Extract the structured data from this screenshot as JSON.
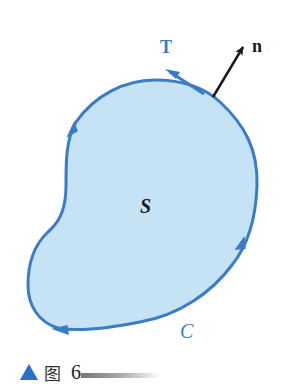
{
  "figure": {
    "labels": {
      "tangent": "T",
      "normal": "n",
      "surface": "S",
      "curve": "C"
    },
    "colors": {
      "region_fill": "#c6e3f6",
      "outline": "#3a7cc6",
      "normal_arrow": "#1a1a1a"
    },
    "icons": [
      "tangent-arrow",
      "normal-arrow",
      "orientation-arrow"
    ]
  },
  "caption": {
    "marker": "▲",
    "word": "图",
    "number": "6"
  }
}
